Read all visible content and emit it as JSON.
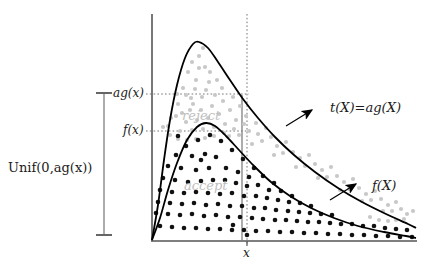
{
  "figure": {
    "title_caption": "",
    "axis": {
      "origin_x": 152,
      "origin_y": 240,
      "y_top": 14,
      "x_right": 416
    },
    "labels": {
      "unif": "Unif(0,",
      "unif_italic": "ag",
      "unif_tail": "(x))",
      "unif_full": "Unif(0,ag(x))",
      "ag_x": "ag(x)",
      "f_x": "f(x)",
      "t_X": "t(X)=ag(X)",
      "f_X": "f(X)",
      "x_tick": "x",
      "reject": "reject",
      "accept": "accept"
    },
    "colors": {
      "curve": "#000000",
      "accept_dots": "#111111",
      "reject_dots": "#c8c8c8",
      "region_label": "#c0c0c0",
      "axis": "#555555",
      "bracket": "#888888",
      "guide": "#777777",
      "arrow": "#000000"
    }
  },
  "chart_data": {
    "type": "scatter",
    "xlabel": "x",
    "ylabel": "",
    "grid": false,
    "legend_position": "inline-annotations",
    "annotations": [
      {
        "text": "t(X)=ag(X)",
        "target": "envelope-curve"
      },
      {
        "text": "f(X)",
        "target": "density-curve"
      },
      {
        "text": "reject",
        "region": "between f and ag"
      },
      {
        "text": "accept",
        "region": "under f"
      },
      {
        "text": "Unif(0,ag(x))",
        "target": "vertical-bracket"
      }
    ],
    "tick_labels": {
      "y": [
        "ag(x)",
        "f(x)"
      ],
      "x": [
        "x"
      ]
    },
    "series": [
      {
        "name": "t(X)=ag(X)",
        "kind": "line",
        "color": "#000000",
        "points": [
          [
            152,
            240
          ],
          [
            158,
            205
          ],
          [
            164,
            160
          ],
          [
            170,
            120
          ],
          [
            177,
            85
          ],
          [
            185,
            58
          ],
          [
            193,
            44
          ],
          [
            199,
            42
          ],
          [
            208,
            48
          ],
          [
            218,
            62
          ],
          [
            230,
            80
          ],
          [
            243,
            99
          ],
          [
            258,
            118
          ],
          [
            275,
            137
          ],
          [
            294,
            155
          ],
          [
            315,
            172
          ],
          [
            338,
            188
          ],
          [
            362,
            202
          ],
          [
            386,
            214
          ],
          [
            408,
            224
          ],
          [
            416,
            228
          ]
        ]
      },
      {
        "name": "f(X)",
        "kind": "line",
        "color": "#000000",
        "points": [
          [
            152,
            240
          ],
          [
            160,
            218
          ],
          [
            168,
            190
          ],
          [
            177,
            163
          ],
          [
            187,
            140
          ],
          [
            197,
            127
          ],
          [
            206,
            123
          ],
          [
            215,
            126
          ],
          [
            226,
            136
          ],
          [
            239,
            150
          ],
          [
            254,
            166
          ],
          [
            271,
            182
          ],
          [
            290,
            196
          ],
          [
            311,
            208
          ],
          [
            334,
            218
          ],
          [
            358,
            226
          ],
          [
            384,
            232
          ],
          [
            406,
            236
          ],
          [
            416,
            238
          ]
        ]
      },
      {
        "name": "reject (gray dots)",
        "kind": "scatter",
        "color": "#c8c8c8",
        "points": [
          [
            188,
            72
          ],
          [
            199,
            56
          ],
          [
            205,
            67
          ],
          [
            196,
            80
          ],
          [
            183,
            88
          ],
          [
            209,
            82
          ],
          [
            215,
            95
          ],
          [
            191,
            98
          ],
          [
            202,
            97
          ],
          [
            222,
            88
          ],
          [
            178,
            104
          ],
          [
            190,
            110
          ],
          [
            201,
            110
          ],
          [
            212,
            106
          ],
          [
            223,
            101
          ],
          [
            233,
            97
          ],
          [
            176,
            116
          ],
          [
            186,
            122
          ],
          [
            197,
            120
          ],
          [
            208,
            118
          ],
          [
            219,
            114
          ],
          [
            230,
            110
          ],
          [
            240,
            106
          ],
          [
            168,
            126
          ],
          [
            180,
            131
          ],
          [
            192,
            130
          ],
          [
            203,
            129
          ],
          [
            214,
            127
          ],
          [
            225,
            124
          ],
          [
            236,
            120
          ],
          [
            246,
            116
          ],
          [
            256,
            123
          ],
          [
            249,
            131
          ],
          [
            239,
            135
          ],
          [
            229,
            136
          ],
          [
            258,
            134
          ],
          [
            266,
            128
          ],
          [
            262,
            141
          ],
          [
            252,
            144
          ],
          [
            271,
            137
          ],
          [
            277,
            146
          ],
          [
            286,
            142
          ],
          [
            283,
            153
          ],
          [
            274,
            155
          ],
          [
            293,
            152
          ],
          [
            300,
            158
          ],
          [
            309,
            155
          ],
          [
            305,
            166
          ],
          [
            296,
            167
          ],
          [
            315,
            164
          ],
          [
            322,
            170
          ],
          [
            331,
            167
          ],
          [
            327,
            177
          ],
          [
            318,
            178
          ],
          [
            337,
            176
          ],
          [
            344,
            182
          ],
          [
            353,
            179
          ],
          [
            349,
            189
          ],
          [
            340,
            190
          ],
          [
            359,
            188
          ],
          [
            366,
            194
          ],
          [
            375,
            191
          ],
          [
            371,
            200
          ],
          [
            362,
            201
          ],
          [
            381,
            199
          ],
          [
            388,
            205
          ],
          [
            396,
            202
          ],
          [
            392,
            211
          ],
          [
            383,
            211
          ],
          [
            401,
            209
          ],
          [
            407,
            214
          ],
          [
            413,
            211
          ],
          [
            404,
            219
          ],
          [
            396,
            220
          ],
          [
            388,
            221
          ],
          [
            379,
            220
          ],
          [
            370,
            217
          ],
          [
            244,
            124
          ],
          [
            234,
            129
          ],
          [
            224,
            133
          ],
          [
            214,
            136
          ],
          [
            205,
            138
          ],
          [
            196,
            139
          ],
          [
            187,
            140
          ],
          [
            178,
            139
          ],
          [
            170,
            135
          ],
          [
            163,
            127
          ],
          [
            171,
            118
          ],
          [
            182,
            113
          ],
          [
            193,
            104
          ],
          [
            186,
            95
          ],
          [
            177,
            94
          ],
          [
            195,
            89
          ],
          [
            206,
            90
          ],
          [
            217,
            80
          ],
          [
            210,
            72
          ],
          [
            199,
            68
          ],
          [
            192,
            62
          ],
          [
            203,
            48
          ]
        ]
      },
      {
        "name": "accept (black dots)",
        "kind": "scatter",
        "color": "#111111",
        "points": [
          [
            210,
            135
          ],
          [
            198,
            140
          ],
          [
            186,
            146
          ],
          [
            221,
            141
          ],
          [
            232,
            150
          ],
          [
            176,
            155
          ],
          [
            192,
            156
          ],
          [
            205,
            154
          ],
          [
            216,
            157
          ],
          [
            243,
            159
          ],
          [
            254,
            168
          ],
          [
            168,
            166
          ],
          [
            181,
            168
          ],
          [
            196,
            170
          ],
          [
            209,
            168
          ],
          [
            226,
            168
          ],
          [
            238,
            172
          ],
          [
            249,
            177
          ],
          [
            263,
            176
          ],
          [
            274,
            183
          ],
          [
            163,
            178
          ],
          [
            175,
            180
          ],
          [
            188,
            182
          ],
          [
            201,
            181
          ],
          [
            213,
            180
          ],
          [
            225,
            180
          ],
          [
            236,
            183
          ],
          [
            247,
            186
          ],
          [
            258,
            185
          ],
          [
            269,
            190
          ],
          [
            281,
            191
          ],
          [
            292,
            196
          ],
          [
            160,
            190
          ],
          [
            172,
            192
          ],
          [
            184,
            193
          ],
          [
            196,
            192
          ],
          [
            208,
            193
          ],
          [
            220,
            194
          ],
          [
            232,
            193
          ],
          [
            244,
            196
          ],
          [
            256,
            196
          ],
          [
            267,
            198
          ],
          [
            278,
            200
          ],
          [
            289,
            202
          ],
          [
            300,
            203
          ],
          [
            311,
            206
          ],
          [
            158,
            202
          ],
          [
            170,
            203
          ],
          [
            182,
            204
          ],
          [
            194,
            203
          ],
          [
            206,
            205
          ],
          [
            218,
            204
          ],
          [
            230,
            206
          ],
          [
            242,
            206
          ],
          [
            254,
            208
          ],
          [
            265,
            208
          ],
          [
            276,
            210
          ],
          [
            288,
            211
          ],
          [
            299,
            212
          ],
          [
            310,
            213
          ],
          [
            321,
            214
          ],
          [
            332,
            215
          ],
          [
            156,
            213
          ],
          [
            168,
            214
          ],
          [
            180,
            215
          ],
          [
            192,
            214
          ],
          [
            204,
            216
          ],
          [
            216,
            215
          ],
          [
            228,
            217
          ],
          [
            240,
            217
          ],
          [
            252,
            218
          ],
          [
            263,
            219
          ],
          [
            275,
            220
          ],
          [
            286,
            220
          ],
          [
            297,
            221
          ],
          [
            308,
            222
          ],
          [
            319,
            222
          ],
          [
            330,
            223
          ],
          [
            341,
            224
          ],
          [
            352,
            224
          ],
          [
            363,
            226
          ],
          [
            374,
            226
          ],
          [
            385,
            228
          ],
          [
            396,
            229
          ],
          [
            407,
            230
          ],
          [
            160,
            226
          ],
          [
            172,
            227
          ],
          [
            184,
            228
          ],
          [
            196,
            228
          ],
          [
            208,
            229
          ],
          [
            220,
            229
          ],
          [
            232,
            230
          ],
          [
            244,
            230
          ],
          [
            256,
            231
          ],
          [
            268,
            231
          ],
          [
            280,
            232
          ],
          [
            292,
            232
          ],
          [
            304,
            233
          ],
          [
            316,
            233
          ],
          [
            328,
            234
          ],
          [
            340,
            234
          ],
          [
            352,
            235
          ],
          [
            364,
            235
          ],
          [
            376,
            236
          ],
          [
            388,
            236
          ],
          [
            400,
            237
          ],
          [
            412,
            237
          ],
          [
            247,
            235
          ],
          [
            233,
            225
          ],
          [
            201,
            160
          ],
          [
            178,
            136
          ]
        ]
      }
    ],
    "guides": [
      {
        "type": "hline",
        "label": "ag(x)",
        "y": 94,
        "x_from": 146,
        "x_to": 249,
        "style": "dotted"
      },
      {
        "type": "hline",
        "label": "f(x)",
        "y": 131,
        "x_from": 146,
        "x_to": 249,
        "style": "dotted"
      },
      {
        "type": "vline",
        "label": "x",
        "x": 247,
        "y_from": 14,
        "y_to": 244,
        "style": "dotted"
      }
    ],
    "bracket": {
      "label": "Unif(0,ag(x))",
      "x": 104,
      "y_top": 93,
      "y_bottom": 235
    }
  }
}
